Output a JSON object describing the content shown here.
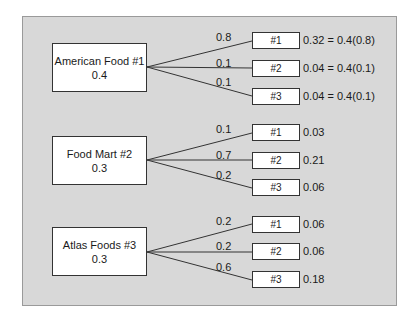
{
  "diagram": {
    "type": "probability-tree",
    "colors": {
      "panel_bg": "#d8d8d8",
      "panel_border": "#9a9a9a",
      "box_bg": "#ffffff",
      "line": "#333333"
    },
    "suppliers": [
      {
        "name": "American Food #1",
        "prior": "0.4",
        "branches": [
          {
            "prob": "0.8",
            "label": "#1",
            "joint": "0.32 = 0.4(0.8)"
          },
          {
            "prob": "0.1",
            "label": "#2",
            "joint": "0.04 = 0.4(0.1)"
          },
          {
            "prob": "0.1",
            "label": "#3",
            "joint": "0.04 = 0.4(0.1)"
          }
        ]
      },
      {
        "name": "Food Mart #2",
        "prior": "0.3",
        "branches": [
          {
            "prob": "0.1",
            "label": "#1",
            "joint": "0.03"
          },
          {
            "prob": "0.7",
            "label": "#2",
            "joint": "0.21"
          },
          {
            "prob": "0.2",
            "label": "#3",
            "joint": "0.06"
          }
        ]
      },
      {
        "name": "Atlas Foods #3",
        "prior": "0.3",
        "branches": [
          {
            "prob": "0.2",
            "label": "#1",
            "joint": "0.06"
          },
          {
            "prob": "0.2",
            "label": "#2",
            "joint": "0.06"
          },
          {
            "prob": "0.6",
            "label": "#3",
            "joint": "0.18"
          }
        ]
      }
    ]
  }
}
